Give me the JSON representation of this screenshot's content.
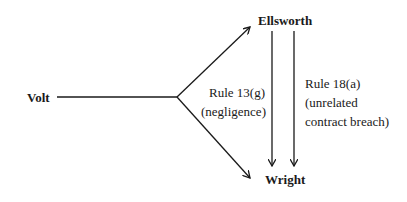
{
  "diagram": {
    "nodes": {
      "volt": "Volt",
      "ellsworth": "Ellsworth",
      "wright": "Wright"
    },
    "edges": [
      {
        "from": "Volt",
        "to": "Ellsworth",
        "label": ""
      },
      {
        "from": "Volt",
        "to": "Wright",
        "label": ""
      },
      {
        "from": "Ellsworth",
        "to": "Wright",
        "label_line1": "Rule 13(g)",
        "label_line2": "(negligence)"
      },
      {
        "from": "Ellsworth",
        "to": "Wright",
        "label_line1": "Rule 18(a)",
        "label_line2": "(unrelated",
        "label_line3": "contract breach)"
      }
    ],
    "colors": {
      "ink": "#1a1a1a",
      "background": "#ffffff"
    }
  }
}
